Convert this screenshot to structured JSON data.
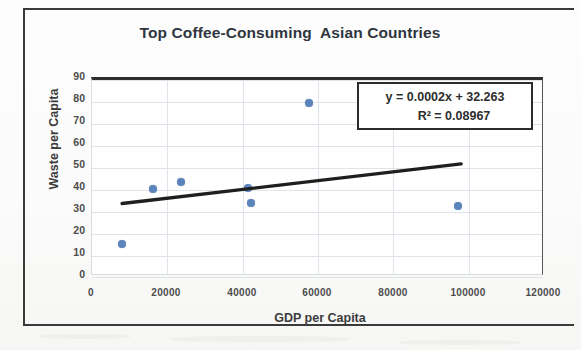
{
  "chart_data": {
    "type": "scatter",
    "title": "Top Coffee-Consuming  Asian Countries",
    "xlabel": "GDP per Capita",
    "ylabel": "Waste per Capita",
    "xlim": [
      0,
      120000
    ],
    "ylim": [
      0,
      90
    ],
    "x_ticks": [
      "0",
      "20000",
      "40000",
      "60000",
      "80000",
      "100000",
      "120000"
    ],
    "y_ticks": [
      "90",
      "80",
      "70",
      "60",
      "50",
      "40",
      "30",
      "20",
      "10",
      "0"
    ],
    "grid": true,
    "legend": "none",
    "series": [
      {
        "name": "Waste per Capita vs GDP per Capita",
        "marker_color": "#5b84bd",
        "points": [
          {
            "x": 8000,
            "y": 15.5
          },
          {
            "x": 16200,
            "y": 40.5
          },
          {
            "x": 23600,
            "y": 43.5
          },
          {
            "x": 41400,
            "y": 41.0
          },
          {
            "x": 42200,
            "y": 34.0
          },
          {
            "x": 57600,
            "y": 79.5
          },
          {
            "x": 97200,
            "y": 32.7
          }
        ]
      }
    ],
    "trendline": {
      "type": "linear",
      "color": "#1f1f1f",
      "slope": 0.0002,
      "intercept": 32.263,
      "x_start": 8000,
      "x_end": 98000,
      "equation": "y = 0.0002x + 32.263",
      "r_squared_label": "R² = 0.08967",
      "r_squared": 0.08967
    },
    "annotation_box": {
      "line1": "y = 0.0002x + 32.263",
      "line2": "R² = 0.08967"
    }
  }
}
